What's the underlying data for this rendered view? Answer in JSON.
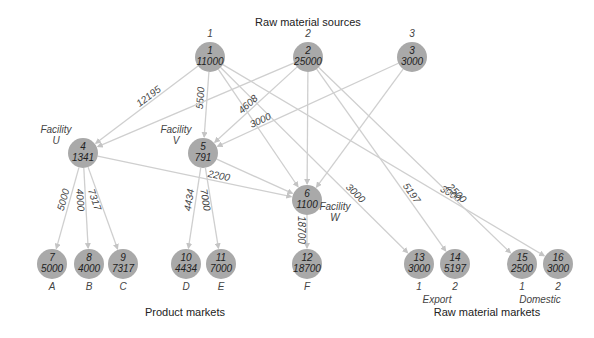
{
  "titles": {
    "sources": "Raw material sources",
    "product_markets": "Product markets",
    "raw_material_markets": "Raw material markets"
  },
  "colors": {
    "node_fill": "#a9a9a9",
    "edge": "#cfcfcf",
    "text": "#222222"
  },
  "nodes": [
    {
      "id": "1",
      "value": "11000",
      "x": 210,
      "y": 57,
      "top_label": "1"
    },
    {
      "id": "2",
      "value": "25000",
      "x": 308,
      "y": 57,
      "top_label": "2"
    },
    {
      "id": "3",
      "value": "3000",
      "x": 412,
      "y": 57,
      "top_label": "3"
    },
    {
      "id": "4",
      "value": "1341",
      "x": 83,
      "y": 153,
      "side_label": [
        "Facility",
        "U"
      ]
    },
    {
      "id": "5",
      "value": "791",
      "x": 203,
      "y": 153,
      "side_label": [
        "Facility",
        "V"
      ]
    },
    {
      "id": "6",
      "value": "1100",
      "x": 307,
      "y": 200,
      "side_label": [
        "Facility",
        "W"
      ]
    },
    {
      "id": "7",
      "value": "5000",
      "x": 52,
      "y": 264,
      "bottom_label": "A"
    },
    {
      "id": "8",
      "value": "4000",
      "x": 89,
      "y": 264,
      "bottom_label": "B"
    },
    {
      "id": "9",
      "value": "7317",
      "x": 123,
      "y": 264,
      "bottom_label": "C"
    },
    {
      "id": "10",
      "value": "4434",
      "x": 186,
      "y": 264,
      "bottom_label": "D"
    },
    {
      "id": "11",
      "value": "7000",
      "x": 221,
      "y": 264,
      "bottom_label": "E"
    },
    {
      "id": "12",
      "value": "18700",
      "x": 307,
      "y": 264,
      "bottom_label": "F"
    },
    {
      "id": "13",
      "value": "3000",
      "x": 419,
      "y": 264,
      "bottom_label": "1"
    },
    {
      "id": "14",
      "value": "5197",
      "x": 455,
      "y": 264,
      "bottom_label": "2"
    },
    {
      "id": "15",
      "value": "2500",
      "x": 522,
      "y": 264,
      "bottom_label": "1"
    },
    {
      "id": "16",
      "value": "3000",
      "x": 558,
      "y": 264,
      "bottom_label": "2"
    }
  ],
  "group_labels": {
    "export": "Export",
    "domestic": "Domestic"
  },
  "edges": [
    {
      "from": "1",
      "to": "4",
      "label": "12195"
    },
    {
      "from": "1",
      "to": "5",
      "label": "5500"
    },
    {
      "from": "1",
      "to": "6",
      "label": ""
    },
    {
      "from": "1",
      "to": "13",
      "label": "3000"
    },
    {
      "from": "1",
      "to": "16",
      "label": "3000"
    },
    {
      "from": "2",
      "to": "4",
      "label": ""
    },
    {
      "from": "2",
      "to": "5",
      "label": "4608"
    },
    {
      "from": "2",
      "to": "6",
      "label": ""
    },
    {
      "from": "2",
      "to": "14",
      "label": "5197"
    },
    {
      "from": "2",
      "to": "15",
      "label": "2500"
    },
    {
      "from": "3",
      "to": "5",
      "label": "3000"
    },
    {
      "from": "3",
      "to": "6",
      "label": ""
    },
    {
      "from": "4",
      "to": "6",
      "label": "2200"
    },
    {
      "from": "4",
      "to": "7",
      "label": "5000"
    },
    {
      "from": "4",
      "to": "8",
      "label": "4000"
    },
    {
      "from": "4",
      "to": "9",
      "label": "7317"
    },
    {
      "from": "5",
      "to": "6",
      "label": ""
    },
    {
      "from": "5",
      "to": "10",
      "label": "4434"
    },
    {
      "from": "5",
      "to": "11",
      "label": "7000"
    },
    {
      "from": "6",
      "to": "12",
      "label": "18700"
    }
  ]
}
